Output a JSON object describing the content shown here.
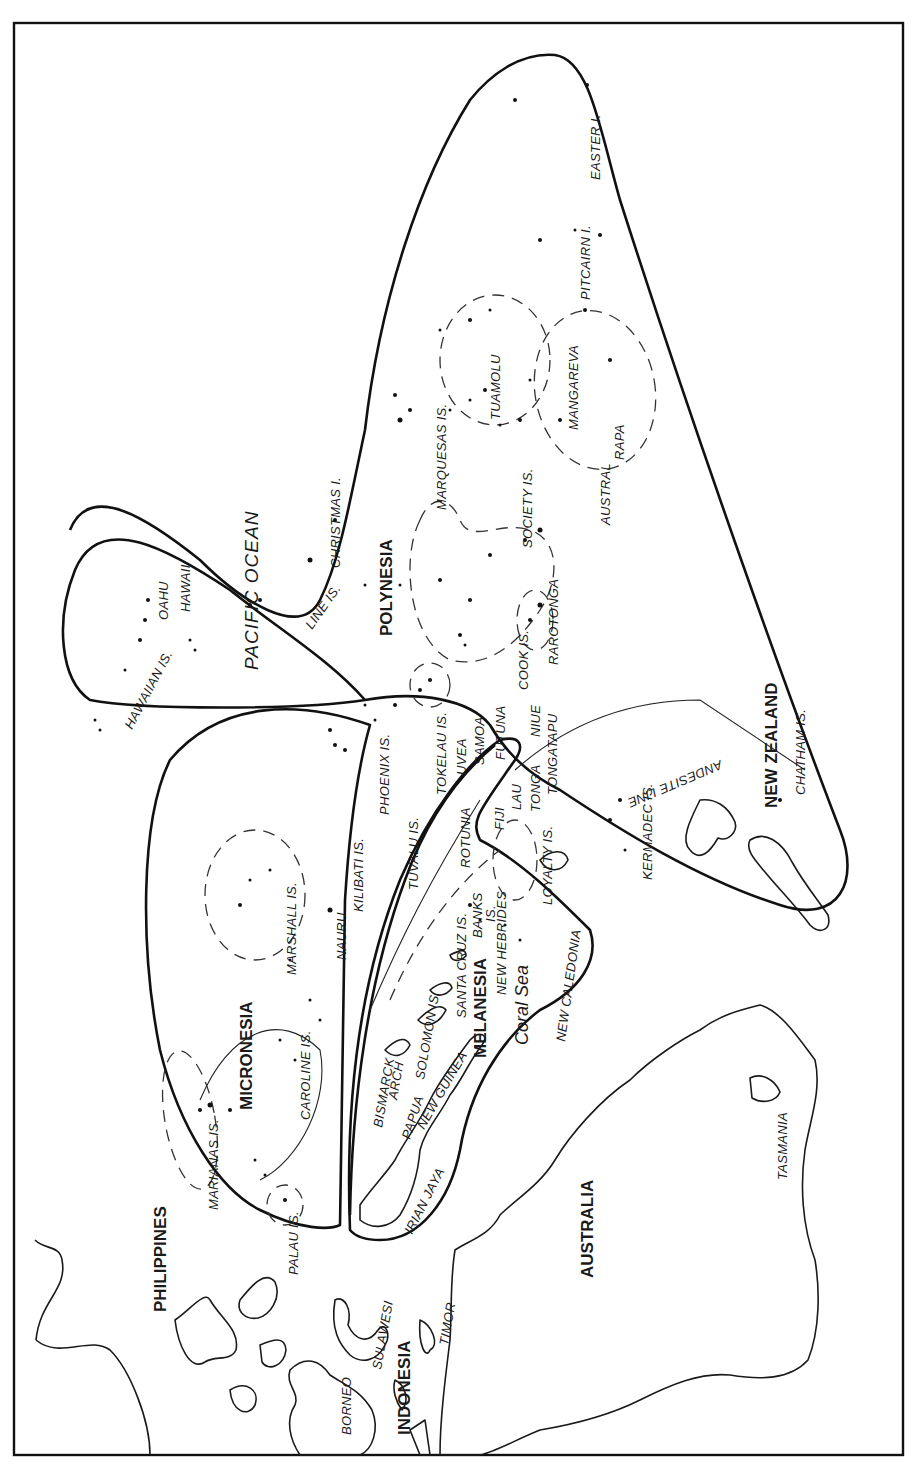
{
  "map": {
    "orientation": "rotated 90° counter-clockwise (north points left)",
    "colors": {
      "ink": "#1a1a1a",
      "background": "#ffffff"
    },
    "regions": {
      "polynesia": "POLYNESIA",
      "micronesia": "MICRONESIA",
      "melanesia": "MELANESIA"
    },
    "landmasses": {
      "philippines": "PHILIPPINES",
      "indonesia": "INDONESIA",
      "australia": "AUSTRALIA",
      "new_zealand": "NEW ZEALAND"
    },
    "water": {
      "pacific_ocean": "PACIFIC OCEAN",
      "coral_sea": "Coral Sea"
    },
    "line_label": "ANDESITE LINE",
    "places": {
      "borneo": "BORNEO",
      "sulawesi": "SULAWESI",
      "timor": "TIMOR",
      "palau": "PALAU IS.",
      "marianas": "MARIANAS IS.",
      "caroline": "CAROLINE IS.",
      "marshall": "MARSHALL IS.",
      "nauru": "NAURU",
      "kilibati": "KILIBATI IS.",
      "tuvalu": "TUVALU IS.",
      "phoenix": "PHOENIX IS.",
      "tokelau": "TOKELAU IS.",
      "uvea": "UVEA",
      "samoa": "SAMOA",
      "futuna": "FUTUNA",
      "fiji": "FIJI",
      "lau": "LAU",
      "tonga": "TONGA",
      "tongatapu": "TONGATAPU",
      "niue": "NIUE",
      "rotunia": "ROTUNIA",
      "hawaiian": "HAWAIIAN IS.",
      "oahu": "OAHU",
      "hawaii": "HAWAII",
      "line_is": "LINE IS.",
      "christmas": "CHRISTMAS I.",
      "marquesas": "MARQUESAS IS.",
      "tuamolu": "TUAMOLU",
      "society": "SOCIETY IS.",
      "mangareva": "MANGAREVA",
      "austral": "AUSTRAL",
      "rapa": "RAPA",
      "cook": "COOK IS.",
      "rarotonga": "RAROTONGA",
      "pitcairn": "PITCAIRN I.",
      "easter": "EASTER I.",
      "kermadec": "KERMADEC IS.",
      "chatham": "CHATHAM IS.",
      "irian_jaya": "IRIAN JAYA",
      "papua_new_guinea_1": "PAPUA",
      "papua_new_guinea_2": "NEW GUINEA",
      "bismarck_1": "BISMARCK",
      "bismarck_2": "ARCH",
      "solomon": "SOLOMON IS.",
      "santa_cruz": "SANTA CRUZ IS.",
      "banks_1": "BANKS",
      "banks_2": "IS.",
      "new_hebrides": "NEW HEBRIDES",
      "loyalty": "LOYALTY IS.",
      "new_caledonia": "NEW CALEDONIA",
      "tasmania": "TASMANIA"
    }
  }
}
